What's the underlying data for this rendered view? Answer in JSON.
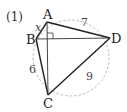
{
  "problem": {
    "number_label": "(1)"
  },
  "figure": {
    "type": "cyclic-quadrilateral",
    "circle": {
      "style": "dashed",
      "color": "#aaaaaa"
    },
    "points": {
      "A": {
        "label": "A",
        "x": 47,
        "y": 22
      },
      "B": {
        "label": "B",
        "x": 36,
        "y": 39
      },
      "C": {
        "label": "C",
        "x": 48,
        "y": 95
      },
      "D": {
        "label": "D",
        "x": 110,
        "y": 38
      }
    },
    "segments": [
      {
        "from": "A",
        "to": "B",
        "label": "x"
      },
      {
        "from": "A",
        "to": "D",
        "label": "7"
      },
      {
        "from": "B",
        "to": "C",
        "label": "6"
      },
      {
        "from": "C",
        "to": "D",
        "label": "9"
      },
      {
        "from": "A",
        "to": "C",
        "label": ""
      },
      {
        "from": "B",
        "to": "D",
        "label": ""
      }
    ],
    "right_angle": {
      "at": "intersection of AC and BD"
    },
    "labels": {
      "A": "A",
      "B": "B",
      "C": "C",
      "D": "D",
      "AB": "x",
      "AD": "7",
      "BC": "6",
      "CD": "9"
    },
    "line_color": "#222222"
  }
}
